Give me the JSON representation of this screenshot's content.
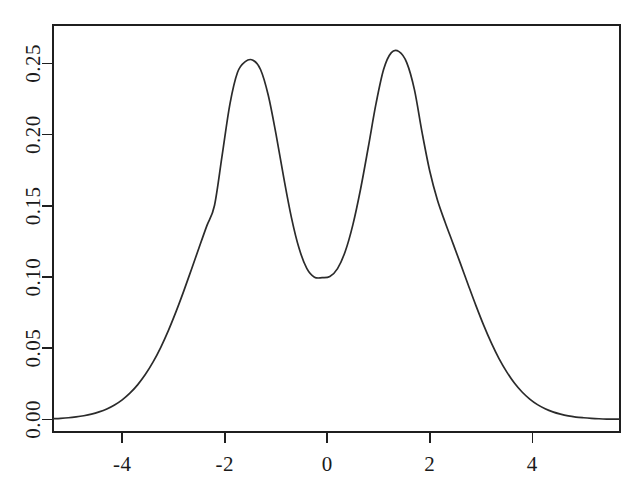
{
  "chart_data": {
    "type": "line",
    "title": "",
    "subtitle": "",
    "xlabel": "",
    "ylabel": "",
    "xlim": [
      -5.35,
      5.71
    ],
    "ylim": [
      -0.0088,
      0.2769
    ],
    "xticks": [
      -4,
      -2,
      0,
      2,
      4
    ],
    "xticklabels": [
      "-4",
      "-2",
      "0",
      "2",
      "4"
    ],
    "yticks": [
      0.0,
      0.05,
      0.1,
      0.15,
      0.2,
      0.25
    ],
    "yticklabels": [
      "0.00",
      "0.05",
      "0.10",
      "0.15",
      "0.20",
      "0.25"
    ],
    "grid": false,
    "legend": null,
    "legend_position": "none",
    "box": true,
    "tick_direction": "out",
    "line_color": "#2b2b2b",
    "axis_color": "#1f1f1f",
    "background_color": "#ffffff",
    "annotations": [],
    "series": [
      {
        "name": "density",
        "x": [
          -5.35,
          -5.2,
          -5.05,
          -4.9,
          -4.75,
          -4.6,
          -4.45,
          -4.3,
          -4.15,
          -4.0,
          -3.85,
          -3.7,
          -3.55,
          -3.4,
          -3.25,
          -3.1,
          -2.95,
          -2.8,
          -2.65,
          -2.5,
          -2.35,
          -2.2,
          -2.05,
          -1.9,
          -1.75,
          -1.6,
          -1.45,
          -1.3,
          -1.15,
          -1.0,
          -0.85,
          -0.7,
          -0.55,
          -0.4,
          -0.25,
          -0.1,
          0.05,
          0.2,
          0.35,
          0.5,
          0.65,
          0.8,
          0.95,
          1.1,
          1.25,
          1.4,
          1.55,
          1.7,
          1.85,
          2.0,
          2.15,
          2.3,
          2.45,
          2.6,
          2.75,
          2.9,
          3.05,
          3.2,
          3.35,
          3.5,
          3.65,
          3.8,
          3.95,
          4.1,
          4.25,
          4.4,
          4.55,
          4.7,
          4.85,
          5.0,
          5.15,
          5.3,
          5.45,
          5.6,
          5.71
        ],
        "y": [
          0.0005,
          0.0008,
          0.0012,
          0.0018,
          0.0026,
          0.0037,
          0.0053,
          0.0074,
          0.0102,
          0.0138,
          0.0185,
          0.0243,
          0.0315,
          0.0402,
          0.0505,
          0.0624,
          0.0757,
          0.0901,
          0.1053,
          0.1207,
          0.1359,
          0.1502,
          0.1855,
          0.2212,
          0.2437,
          0.2512,
          0.2522,
          0.2455,
          0.2274,
          0.2003,
          0.1699,
          0.1419,
          0.1201,
          0.1061,
          0.0999,
          0.0995,
          0.1003,
          0.1059,
          0.1179,
          0.1368,
          0.1618,
          0.1911,
          0.2215,
          0.2458,
          0.2575,
          0.2582,
          0.2505,
          0.2315,
          0.2013,
          0.1742,
          0.1538,
          0.1383,
          0.1238,
          0.1092,
          0.0944,
          0.0799,
          0.0662,
          0.0537,
          0.0427,
          0.0334,
          0.0256,
          0.0193,
          0.0143,
          0.0104,
          0.0075,
          0.0053,
          0.0037,
          0.0025,
          0.0017,
          0.0012,
          0.0008,
          0.0005,
          0.0003,
          0.0002,
          0.0002
        ]
      }
    ],
    "peaks": [
      {
        "x": -1.45,
        "y": 0.2522,
        "label": "left mode"
      },
      {
        "x": 1.43,
        "y": 0.2582,
        "label": "right mode"
      }
    ],
    "valley": {
      "x": -0.05,
      "y": 0.0995,
      "label": "antimode"
    }
  }
}
